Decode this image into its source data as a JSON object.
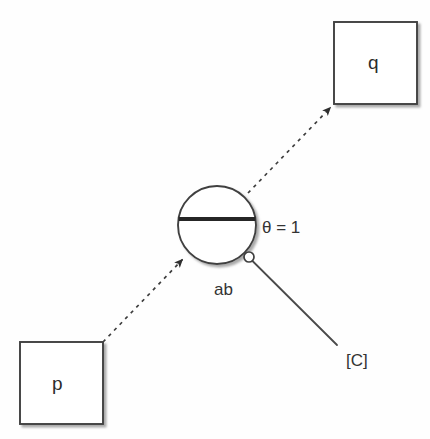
{
  "diagram": {
    "type": "petri-net-fragment",
    "background_color": "#fefefe",
    "stroke_color": "#3a3a3a",
    "bar_color": "#262626",
    "shadow_color": "#b5b5b5",
    "places": [
      {
        "id": "p",
        "label": "p",
        "shape": "square",
        "x": 20,
        "y": 342,
        "width": 83,
        "height": 82
      },
      {
        "id": "q",
        "label": "q",
        "shape": "square",
        "x": 334,
        "y": 22,
        "width": 83,
        "height": 82
      }
    ],
    "transition": {
      "id": "ab",
      "label": "ab",
      "shape": "circle-with-bar",
      "cx": 217,
      "cy": 225,
      "r": 39,
      "bar_y": 219,
      "bar_thickness": 4
    },
    "guard": {
      "label": "θ = 1",
      "x": 262,
      "y": 219
    },
    "context_port": {
      "label": "[C]",
      "x": 346,
      "y": 352,
      "handle_cx": 249,
      "handle_cy": 257,
      "handle_r": 5,
      "line_from_x": 252,
      "line_from_y": 261,
      "line_to_x": 337,
      "line_to_y": 345
    },
    "arcs": [
      {
        "id": "arc-p-to-ab",
        "from": "p",
        "to": "ab",
        "style": "dashed",
        "arrowhead": "to",
        "x1": 103,
        "y1": 342,
        "x2": 186,
        "y2": 255
      },
      {
        "id": "arc-ab-to-q",
        "from": "ab",
        "to": "q",
        "style": "dashed",
        "arrowhead": "to",
        "x1": 248,
        "y1": 193,
        "x2": 334,
        "y2": 104
      }
    ]
  }
}
